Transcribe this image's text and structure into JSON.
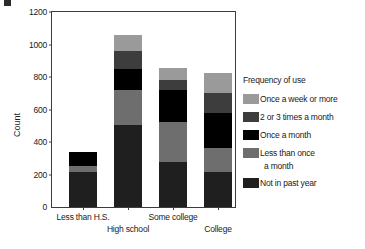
{
  "chart_data": {
    "type": "bar",
    "subtype": "stacked",
    "title": "",
    "xlabel": "",
    "ylabel": "Count",
    "ylim": [
      0,
      1200
    ],
    "yticks": [
      0,
      200,
      400,
      600,
      800,
      1000,
      1200
    ],
    "ytick_labels": [
      "0",
      "200",
      "400",
      "600",
      "800",
      "1000",
      "1200"
    ],
    "grid": false,
    "categories": [
      "Less than H.S.",
      "High school",
      "Some college",
      "College"
    ],
    "legend_title": "Frequency of use",
    "legend_position": "right",
    "series": [
      {
        "name": "Not in past year",
        "color": "#1f1f1f",
        "values": [
          213,
          505,
          275,
          215
        ]
      },
      {
        "name": "Less than once a month",
        "color": "#6e6e6e",
        "values": [
          37,
          215,
          250,
          150
        ]
      },
      {
        "name": "Once a month",
        "color": "#000000",
        "values": [
          90,
          130,
          195,
          215
        ]
      },
      {
        "name": "2 or 3 times a month",
        "color": "#3d3d3d",
        "values": [
          0,
          110,
          60,
          120
        ]
      },
      {
        "name": "Once a week or more",
        "color": "#9a9a9a",
        "values": [
          0,
          100,
          75,
          125
        ]
      }
    ],
    "totals": [
      340,
      1060,
      855,
      825
    ]
  },
  "axis": {
    "y_title": "Count"
  },
  "legend": {
    "title": "Frequency of use",
    "entries": [
      {
        "label": "Once a week or more",
        "color": "#9a9a9a"
      },
      {
        "label": "2 or 3 times a month",
        "color": "#3d3d3d"
      },
      {
        "label": "Once a month",
        "color": "#000000"
      },
      {
        "label": "Less than once",
        "label_cont": "a month",
        "color": "#6e6e6e"
      },
      {
        "label": "Not in past year",
        "color": "#1f1f1f"
      }
    ]
  }
}
